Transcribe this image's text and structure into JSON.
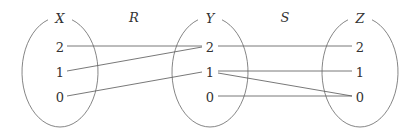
{
  "diagram": {
    "relation_labels": [
      {
        "id": "R",
        "text": "R",
        "x": 134,
        "y": 22
      },
      {
        "id": "S",
        "text": "S",
        "x": 285,
        "y": 22
      }
    ],
    "sets": [
      {
        "id": "X",
        "name": "X",
        "cx": 60,
        "cy": 72,
        "rx": 38,
        "ry": 55,
        "elements": [
          {
            "text": "2",
            "y": 47
          },
          {
            "text": "1",
            "y": 72
          },
          {
            "text": "0",
            "y": 97
          }
        ]
      },
      {
        "id": "Y",
        "name": "Y",
        "cx": 210,
        "cy": 72,
        "rx": 38,
        "ry": 55,
        "elements": [
          {
            "text": "2",
            "y": 47
          },
          {
            "text": "1",
            "y": 72
          },
          {
            "text": "0",
            "y": 97
          }
        ]
      },
      {
        "id": "Z",
        "name": "Z",
        "cx": 360,
        "cy": 72,
        "rx": 38,
        "ry": 55,
        "elements": [
          {
            "text": "2",
            "y": 47
          },
          {
            "text": "1",
            "y": 72
          },
          {
            "text": "0",
            "y": 97
          }
        ]
      }
    ],
    "edges": [
      {
        "relation": "R",
        "from": "X:2",
        "to": "Y:2",
        "x1": 67,
        "y1": 46,
        "x2": 202,
        "y2": 46
      },
      {
        "relation": "R",
        "from": "X:1",
        "to": "Y:2",
        "x1": 67,
        "y1": 71,
        "x2": 202,
        "y2": 47
      },
      {
        "relation": "R",
        "from": "X:0",
        "to": "Y:1",
        "x1": 67,
        "y1": 96,
        "x2": 202,
        "y2": 72
      },
      {
        "relation": "S",
        "from": "Y:2",
        "to": "Z:2",
        "x1": 218,
        "y1": 46,
        "x2": 352,
        "y2": 46
      },
      {
        "relation": "S",
        "from": "Y:1",
        "to": "Z:1",
        "x1": 218,
        "y1": 71,
        "x2": 352,
        "y2": 71
      },
      {
        "relation": "S",
        "from": "Y:1",
        "to": "Z:0",
        "x1": 218,
        "y1": 73,
        "x2": 352,
        "y2": 96
      },
      {
        "relation": "S",
        "from": "Y:0",
        "to": "Z:0",
        "x1": 218,
        "y1": 96,
        "x2": 352,
        "y2": 96
      }
    ]
  }
}
